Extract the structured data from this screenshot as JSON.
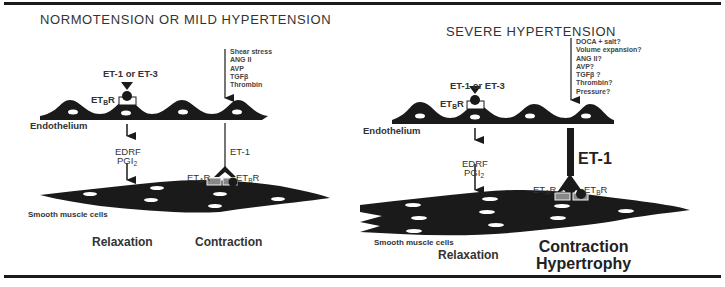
{
  "left_panel": {
    "title": "NORMOTENSION OR MILD HYPERTENSION",
    "ligand": "ET-1 or ET-3",
    "receptor_b": "ET",
    "receptor_b_sub": "B",
    "receptor_suffix": "R",
    "endothelium": "Endothelium",
    "stimuli": [
      "Shear stress",
      "ANG II",
      "AVP",
      "TGFβ",
      "Thrombin"
    ],
    "relax_factor_1": "EDRF",
    "relax_factor_2": "PGI",
    "relax_factor_2_sub": "2",
    "et1": "ET-1",
    "receptor_a": "ET",
    "receptor_a_sub": "A",
    "smooth_muscle": "Smooth muscle cells",
    "relaxation": "Relaxation",
    "contraction": "Contraction"
  },
  "right_panel": {
    "title": "SEVERE HYPERTENSION",
    "ligand": "ET-1 or ET-3",
    "receptor_b": "ET",
    "receptor_b_sub": "B",
    "receptor_suffix": "R",
    "endothelium": "Endothelium",
    "stimuli": [
      "DOCA + salt?",
      "Volume expansion?",
      "ANG II?",
      "AVP?",
      "TGFβ ?",
      "Thrombin?",
      "Pressure?"
    ],
    "relax_factor_1": "EDRF",
    "relax_factor_2": "PGI",
    "relax_factor_2_sub": "2",
    "et1": "ET-1",
    "receptor_a": "ET",
    "receptor_a_sub": "A",
    "smooth_muscle": "Smooth muscle cells",
    "relaxation": "Relaxation",
    "contraction": "Contraction",
    "hypertrophy": "Hypertrophy"
  }
}
